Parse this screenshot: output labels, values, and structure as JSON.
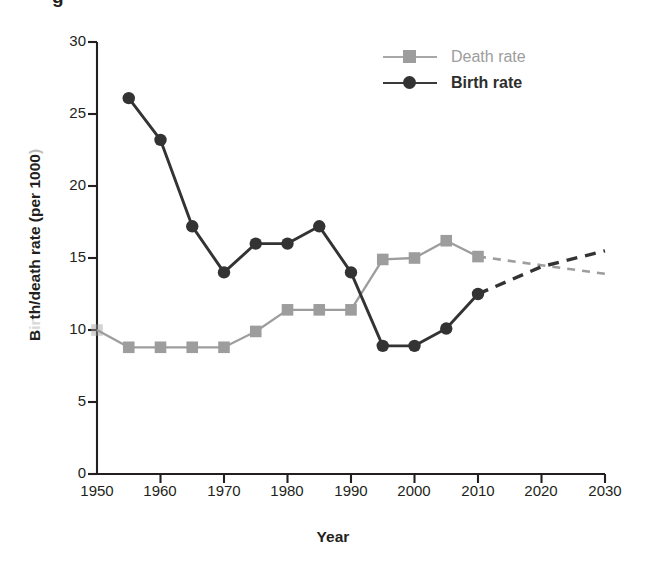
{
  "figure": {
    "cropped_title_fragment": "g",
    "background": "#ffffff"
  },
  "legend": {
    "position": "top-right",
    "items": [
      {
        "label": "Death rate",
        "color": "#9d9d9d",
        "marker": "square",
        "dash": "solid"
      },
      {
        "label": "Birth rate",
        "color": "#333333",
        "marker": "circle",
        "dash": "solid"
      }
    ]
  },
  "axes": {
    "y": {
      "label": "Birth/death rate (per 1000)",
      "label_parts": {
        "pre": "B",
        "faded": "ir",
        "post": "th/death rate (per 1000",
        "tail": ")"
      },
      "ticks": [
        0,
        5,
        10,
        15,
        20,
        25,
        30
      ],
      "min": 0,
      "max": 30
    },
    "x": {
      "label": "Year",
      "ticks": [
        1950,
        1960,
        1970,
        1980,
        1990,
        2000,
        2010,
        2020,
        2030
      ],
      "min": 1950,
      "max": 2030
    }
  },
  "chart_data": {
    "type": "line",
    "title": "",
    "xlabel": "Year",
    "ylabel": "Birth/death rate (per 1000)",
    "xlim": [
      1950,
      2030
    ],
    "ylim": [
      0,
      30
    ],
    "grid": false,
    "legend_position": "top-right",
    "series": [
      {
        "name": "Death rate",
        "color": "#9d9d9d",
        "marker": "square",
        "observed": {
          "x": [
            1950,
            1955,
            1960,
            1965,
            1970,
            1975,
            1980,
            1985,
            1990,
            1995,
            2000,
            2005,
            2010
          ],
          "y": [
            10.0,
            8.8,
            8.8,
            8.8,
            8.8,
            9.9,
            11.4,
            11.4,
            11.4,
            14.9,
            15.0,
            16.2,
            15.1
          ]
        },
        "projected": {
          "x": [
            2010,
            2020,
            2030
          ],
          "y": [
            15.1,
            14.5,
            13.9
          ],
          "style": "dashed"
        }
      },
      {
        "name": "Birth rate",
        "color": "#333333",
        "marker": "circle",
        "observed": {
          "x": [
            1955,
            1960,
            1965,
            1970,
            1975,
            1980,
            1985,
            1990,
            1995,
            2000,
            2005,
            2010
          ],
          "y": [
            26.1,
            23.2,
            17.2,
            14.0,
            16.0,
            16.0,
            17.2,
            14.0,
            8.9,
            8.9,
            10.1,
            12.5
          ]
        },
        "projected": {
          "x": [
            2010,
            2020,
            2030
          ],
          "y": [
            12.5,
            14.4,
            15.5
          ],
          "style": "dashed"
        }
      }
    ],
    "annotations": [
      {
        "text": "lines cross (observed)",
        "x": 1991.5,
        "y": 12.6
      },
      {
        "text": "lines cross (projected)",
        "x": 2020.5,
        "y": 14.45
      }
    ]
  }
}
